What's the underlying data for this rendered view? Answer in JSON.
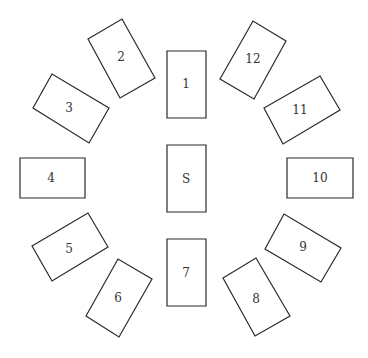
{
  "diagram": {
    "title": "",
    "cards": [
      {
        "label": "1",
        "points": "167,51 206,51 206,118 167,118",
        "cx": 186,
        "cy": 84
      },
      {
        "label": "2",
        "points": "88,39 122,19 155,78 120,98",
        "cx": 121,
        "cy": 57
      },
      {
        "label": "3",
        "points": "33,108 52,74 109,108 89,143",
        "cx": 69,
        "cy": 108
      },
      {
        "label": "4",
        "points": "20,158 85,158 85,198 20,198",
        "cx": 51,
        "cy": 178
      },
      {
        "label": "5",
        "points": "32,246 88,213 108,247 52,281",
        "cx": 69,
        "cy": 249
      },
      {
        "label": "6",
        "points": "86,316 118,259 152,279 119,337",
        "cx": 118,
        "cy": 298
      },
      {
        "label": "7",
        "points": "167,239 206,239 206,306 167,306",
        "cx": 186,
        "cy": 273
      },
      {
        "label": "8",
        "points": "223,278 256,258 290,316 255,336",
        "cx": 256,
        "cy": 299
      },
      {
        "label": "9",
        "points": "265,249 284,214 341,248 321,282",
        "cx": 303,
        "cy": 247
      },
      {
        "label": "10",
        "points": "287,158 353,158 353,198 287,198",
        "cx": 320,
        "cy": 178
      },
      {
        "label": "11",
        "points": "264,108 320,76 340,110 283,144",
        "cx": 300,
        "cy": 110
      },
      {
        "label": "12",
        "points": "220,79 253,21 286,41 254,99",
        "cx": 253,
        "cy": 59
      },
      {
        "label": "S",
        "points": "167,145 206,145 206,212 167,212",
        "cx": 186,
        "cy": 179
      }
    ],
    "colors": {
      "stroke": "#2a2a2a",
      "text": "#333333",
      "background": "#ffffff"
    }
  }
}
